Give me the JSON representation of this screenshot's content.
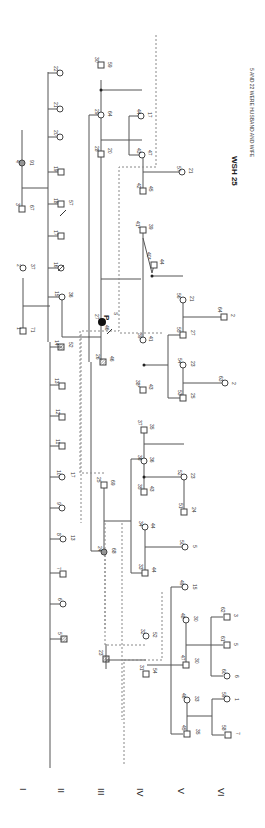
{
  "title": "WSH 25",
  "note": "5 AND 22 WERE HUSBAND AND WIFE",
  "proband_marker": "P",
  "generations": [
    "I",
    "II",
    "III",
    "IV",
    "V",
    "VI"
  ],
  "individuals": [
    {
      "id": "1",
      "age": "71",
      "sex": "M"
    },
    {
      "id": "2",
      "age": "37",
      "sex": "F"
    },
    {
      "id": "3",
      "age": "67",
      "sex": "M"
    },
    {
      "id": "4",
      "age": "91",
      "sex": "F",
      "status": "affected-shaded"
    },
    {
      "id": "5",
      "age": "",
      "sex": "M",
      "status": "hatched"
    },
    {
      "id": "6",
      "age": "",
      "sex": "F"
    },
    {
      "id": "7",
      "age": "",
      "sex": "M"
    },
    {
      "id": "8",
      "age": "13",
      "sex": "F"
    },
    {
      "id": "9",
      "age": "",
      "sex": "F"
    },
    {
      "id": "10",
      "age": "17",
      "sex": "F"
    },
    {
      "id": "11",
      "age": "",
      "sex": "M"
    },
    {
      "id": "12",
      "age": "",
      "sex": "M"
    },
    {
      "id": "13",
      "age": "",
      "sex": "M"
    },
    {
      "id": "14",
      "age": "52",
      "sex": "M",
      "status": "hatched"
    },
    {
      "id": "15",
      "age": "36",
      "sex": "F"
    },
    {
      "id": "16",
      "age": "",
      "sex": "F",
      "status": "deceased"
    },
    {
      "id": "17",
      "age": "",
      "sex": "M"
    },
    {
      "id": "18",
      "age": "57",
      "sex": "M"
    },
    {
      "id": "19",
      "age": "",
      "sex": "M"
    },
    {
      "id": "20",
      "age": "",
      "sex": "F"
    },
    {
      "id": "21",
      "age": "",
      "sex": "F"
    },
    {
      "id": "22",
      "age": "",
      "sex": "F"
    },
    {
      "id": "23",
      "age": "",
      "sex": "M",
      "status": "deceased"
    },
    {
      "id": "24",
      "age": "68",
      "sex": "F",
      "status": "affected-shaded"
    },
    {
      "id": "25",
      "age": "69",
      "sex": "M"
    },
    {
      "id": "26",
      "age": "46",
      "sex": "M",
      "status": "hatched"
    },
    {
      "id": "27",
      "age": "46",
      "sex": "F",
      "status": "proband-affected",
      "note": "S"
    },
    {
      "id": "28",
      "age": "20",
      "sex": "M"
    },
    {
      "id": "29",
      "age": "64",
      "sex": "F"
    },
    {
      "id": "30",
      "age": "59",
      "sex": "M"
    },
    {
      "id": "31",
      "age": "54",
      "sex": "M"
    },
    {
      "id": "32",
      "age": "52",
      "sex": "F"
    },
    {
      "id": "33",
      "age": "44",
      "sex": "M"
    },
    {
      "id": "34",
      "age": "44",
      "sex": "F"
    },
    {
      "id": "35",
      "age": "43",
      "sex": "M"
    },
    {
      "id": "36",
      "age": "36",
      "sex": "F"
    },
    {
      "id": "37",
      "age": "35",
      "sex": "M"
    },
    {
      "id": "38",
      "age": "43",
      "sex": "M",
      "mark": "*"
    },
    {
      "id": "39",
      "age": "41",
      "sex": "F"
    },
    {
      "id": "40",
      "age": "44",
      "sex": "M",
      "mark": "*"
    },
    {
      "id": "41",
      "age": "39",
      "sex": "M",
      "mark": "*"
    },
    {
      "id": "42",
      "age": "45",
      "sex": "M"
    },
    {
      "id": "43",
      "age": "47",
      "sex": "F"
    },
    {
      "id": "44",
      "age": "17",
      "sex": "F"
    },
    {
      "id": "45",
      "age": "35",
      "sex": "M"
    },
    {
      "id": "46",
      "age": "33",
      "sex": "F"
    },
    {
      "id": "47",
      "age": "30",
      "sex": "M"
    },
    {
      "id": "48",
      "age": "30",
      "sex": "F"
    },
    {
      "id": "49",
      "age": "15",
      "sex": "F"
    },
    {
      "id": "50",
      "age": "5",
      "sex": "F"
    },
    {
      "id": "51",
      "age": "24",
      "sex": "M"
    },
    {
      "id": "52",
      "age": "23",
      "sex": "F"
    },
    {
      "id": "53",
      "age": "25",
      "sex": "M"
    },
    {
      "id": "54",
      "age": "23",
      "sex": "F"
    },
    {
      "id": "55",
      "age": "27",
      "sex": "M"
    },
    {
      "id": "56",
      "age": "21",
      "sex": "F"
    },
    {
      "id": "57",
      "age": "21",
      "sex": "F"
    },
    {
      "id": "58",
      "age": "7",
      "sex": "M"
    },
    {
      "id": "59",
      "age": "1",
      "sex": "F"
    },
    {
      "id": "60",
      "age": "6",
      "sex": "F"
    },
    {
      "id": "61",
      "age": "5",
      "sex": "M"
    },
    {
      "id": "62",
      "age": "3",
      "sex": "M"
    },
    {
      "id": "63",
      "age": "2",
      "sex": "F"
    },
    {
      "id": "64",
      "age": "2",
      "sex": "M"
    }
  ]
}
